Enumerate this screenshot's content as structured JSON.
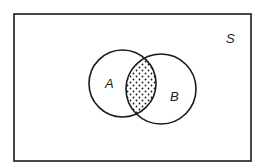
{
  "diagram": {
    "type": "venn",
    "universe_label": "S",
    "sets": [
      {
        "label": "A",
        "cx": 122.5,
        "cy": 83.5,
        "r": 33.5
      },
      {
        "label": "B",
        "cx": 161,
        "cy": 89,
        "r": 35
      }
    ],
    "shaded_region": "A ∩ B",
    "shading": "dotted",
    "colors": {
      "stroke": "#1a1a1a",
      "background": "#ffffff"
    }
  }
}
